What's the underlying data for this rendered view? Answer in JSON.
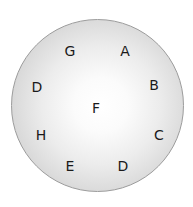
{
  "diagram": {
    "shape": "circle",
    "colors": {
      "border": "#9c9c9c",
      "center_fill": "#ffffff",
      "edge_fill": "#c6c6c6",
      "text": "#1a1a1a"
    },
    "letters": [
      {
        "id": "G",
        "label": "G",
        "x": 70,
        "y": 51
      },
      {
        "id": "A",
        "label": "A",
        "x": 125,
        "y": 51
      },
      {
        "id": "D-left",
        "label": "D",
        "x": 37,
        "y": 87
      },
      {
        "id": "B",
        "label": "B",
        "x": 154,
        "y": 85
      },
      {
        "id": "F",
        "label": "F",
        "x": 96,
        "y": 108
      },
      {
        "id": "H",
        "label": "H",
        "x": 41,
        "y": 135
      },
      {
        "id": "C",
        "label": "C",
        "x": 159,
        "y": 135
      },
      {
        "id": "E",
        "label": "E",
        "x": 70,
        "y": 166
      },
      {
        "id": "D-bottom",
        "label": "D",
        "x": 123,
        "y": 166
      }
    ]
  }
}
